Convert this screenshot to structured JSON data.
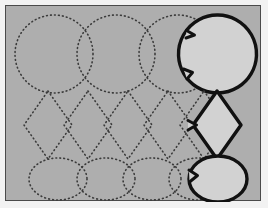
{
  "document": {
    "kind": "tracing-worksheet",
    "title": "Shape Tracing Practice",
    "background_color": "#aeaeae",
    "page_margin_color": "#f2f2f2",
    "frame_color": "#4a4a4a",
    "guide_stroke_color": "#3b3b3b",
    "solid_stroke_color": "#111111",
    "solid_fill_color": "#d2d2d2",
    "guide_style": "dotted",
    "rows_count": 3,
    "rows": [
      {
        "name": "circle-row",
        "shape": "circle",
        "guide_count": 3,
        "solid_count": 1,
        "total_count": 4,
        "center_y": 48,
        "radius_x": 39,
        "radius_y": 39,
        "guide_centers_x": [
          48,
          110,
          172
        ],
        "solid_center_x": 212,
        "solid_notches": 2
      },
      {
        "name": "diamond-row",
        "shape": "diamond",
        "guide_count": 5,
        "solid_count": 1,
        "total_count": 6,
        "center_y": 119,
        "half_width": 24,
        "half_height": 34,
        "guide_centers_x": [
          42,
          82,
          122,
          162,
          198
        ],
        "solid_center_x": 212,
        "solid_notches": 1
      },
      {
        "name": "oval-row",
        "shape": "oval",
        "guide_count": 4,
        "solid_count": 1,
        "total_count": 5,
        "center_y": 173,
        "radius_x": 29,
        "radius_y": 21,
        "guide_centers_x": [
          52,
          100,
          146,
          192
        ],
        "solid_center_x": 212,
        "solid_notches": 1
      }
    ]
  }
}
